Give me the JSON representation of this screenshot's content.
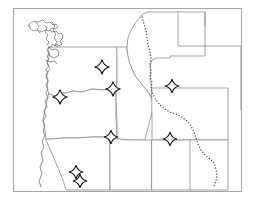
{
  "map": {
    "title": "Northwestern United States reference map",
    "type": "line-art-outline-map",
    "region": "Pacific Northwest and Northern Rocky Mountains",
    "background_color": "#ffffff",
    "frame": {
      "color": "#a8a8a8",
      "x": 13,
      "y": 8,
      "width": 229,
      "height": 184
    },
    "style": {
      "state_border_color": "#8a8a8a",
      "coastline_color": "#6e6e6e",
      "river_color": "#4a4a4a",
      "marker_fill": "#ffffff",
      "marker_stroke": "#111111"
    },
    "states": [
      {
        "name": "Washington",
        "abbr": "WA"
      },
      {
        "name": "Oregon",
        "abbr": "OR"
      },
      {
        "name": "Idaho",
        "abbr": "ID"
      },
      {
        "name": "Montana",
        "abbr": "MT"
      },
      {
        "name": "Wyoming",
        "abbr": "WY"
      },
      {
        "name": "Nevada",
        "abbr": "NV"
      },
      {
        "name": "Utah",
        "abbr": "UT"
      },
      {
        "name": "Colorado",
        "abbr": "CO"
      }
    ],
    "markers": [
      {
        "id": 1,
        "label": "marker-washington-east",
        "x": 102,
        "y": 67,
        "size": 15
      },
      {
        "id": 2,
        "label": "marker-oregon-northwest",
        "x": 60,
        "y": 97,
        "size": 15
      },
      {
        "id": 3,
        "label": "marker-washington-south",
        "x": 113,
        "y": 89,
        "size": 15
      },
      {
        "id": 4,
        "label": "marker-montana-south",
        "x": 172,
        "y": 86,
        "size": 14
      },
      {
        "id": 5,
        "label": "marker-oregon-southeast",
        "x": 111,
        "y": 137,
        "size": 14
      },
      {
        "id": 6,
        "label": "marker-utah-northeast",
        "x": 170,
        "y": 139,
        "size": 14
      },
      {
        "id": 7,
        "label": "marker-nevada-upper",
        "x": 76,
        "y": 172,
        "size": 14
      },
      {
        "id": 8,
        "label": "marker-nevada-lower",
        "x": 80,
        "y": 181,
        "size": 14
      }
    ],
    "features": {
      "coastline": "Pacific coast of Washington and Oregon with Puget Sound and Strait of Juan de Fuca detail",
      "island": "Vancouver Island",
      "dotted_boundary": "Dotted river boundary running south through eastern Montana, Wyoming and Colorado"
    }
  }
}
